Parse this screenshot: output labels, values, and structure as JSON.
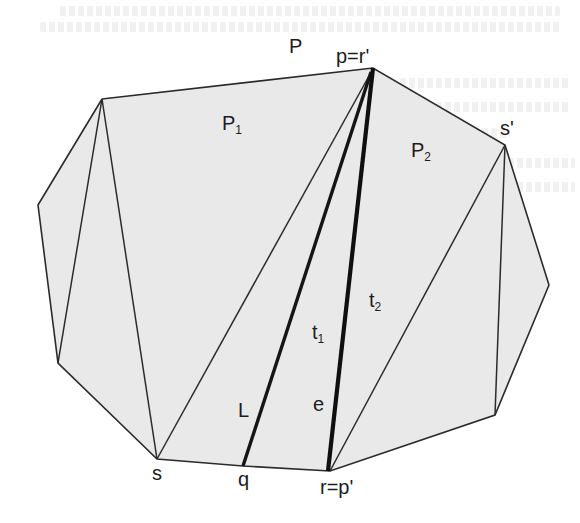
{
  "figure": {
    "type": "polygon-triangulation-diagram",
    "fill_color": "#e9e9e9",
    "edge_color": "#2b2b2b",
    "bold_edge_color": "#111111",
    "background_color": "#ffffff"
  },
  "labels": {
    "polygon": "P",
    "top_vertex": "p=r'",
    "subpolygon_1": "P",
    "subpolygon_1_sub": "1",
    "subpolygon_2": "P",
    "subpolygon_2_sub": "2",
    "right_vertex": "s'",
    "triangle_1": "t",
    "triangle_1_sub": "1",
    "triangle_2": "t",
    "triangle_2_sub": "2",
    "line": "L",
    "edge": "e",
    "left_bottom_vertex": "s",
    "line_endpoint": "q",
    "bottom_vertex": "r=p'"
  },
  "vertices": {
    "A": [
      102,
      99
    ],
    "p": [
      373,
      68
    ],
    "s_prime": [
      505,
      145
    ],
    "R1": [
      549,
      285
    ],
    "R2": [
      495,
      415
    ],
    "r": [
      330,
      471
    ],
    "q": [
      243,
      466
    ],
    "s": [
      157,
      459
    ],
    "Lbot": [
      58,
      363
    ],
    "Lmid": [
      38,
      205
    ]
  }
}
